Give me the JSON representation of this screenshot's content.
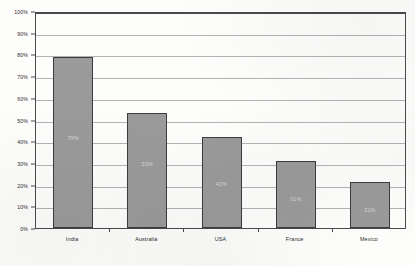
{
  "chart_data": {
    "type": "bar",
    "title": "",
    "subtitle": "",
    "xlabel": "",
    "ylabel": "",
    "categories": [
      "India",
      "Australia",
      "USA",
      "France",
      "Mexico"
    ],
    "values": [
      79,
      53,
      42,
      31,
      21
    ],
    "value_labels": [
      "79%",
      "53%",
      "42%",
      "31%",
      "21%"
    ],
    "value_label_positions_pct": [
      40,
      28,
      19,
      12,
      7
    ],
    "ylim": [
      0,
      100
    ],
    "ytick_values": [
      0,
      10,
      20,
      30,
      40,
      50,
      60,
      70,
      80,
      90,
      100
    ],
    "ytick_labels": [
      "0%",
      "10%",
      "20%",
      "30%",
      "40%",
      "50%",
      "60%",
      "70%",
      "80%",
      "90%",
      "100%"
    ],
    "grid": true,
    "legend": false,
    "legend_position": "none",
    "orientation": "vertical",
    "colors": {
      "bar_fill": "#9a9a9a",
      "bar_border": "#3c3c3c",
      "gridline": "#b3b3b3",
      "axis": "#4a4a4a",
      "value_label_text": "#d8d8d8",
      "tick_text": "#2b2b2b",
      "background": "#fdfdfc"
    }
  }
}
